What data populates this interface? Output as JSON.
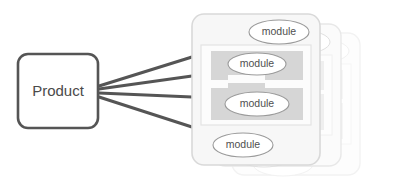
{
  "diagram": {
    "type": "product-modules-architecture",
    "canvas": {
      "width": 411,
      "height": 185,
      "background": "#ffffff"
    },
    "colors": {
      "product_border": "#555555",
      "product_fill": "#ffffff",
      "product_text": "#4a4a4a",
      "connector_line": "#555555",
      "card_border": "#d9d9d9",
      "card_fill": "#f7f7f7",
      "inner_panel_fill": "#fcfcfc",
      "inner_panel_border": "#e3e3e3",
      "band_fill": "#d6d6d6",
      "module_fill": "#ffffff",
      "module_border": "#9a9a9a",
      "module_text": "#4f4f4f",
      "ghost_card_border_1": "#e8e8e8",
      "ghost_card_border_2": "#f2f2f2"
    },
    "product": {
      "label": "Product",
      "x": 18,
      "y": 54,
      "width": 80,
      "height": 74,
      "radius": 10
    },
    "connectors": [
      {
        "name": "connector-1",
        "x1": 99,
        "y1": 86,
        "x2": 192,
        "y2": 57
      },
      {
        "name": "connector-2",
        "x1": 99,
        "y1": 89,
        "x2": 192,
        "y2": 76
      },
      {
        "name": "connector-3",
        "x1": 99,
        "y1": 93,
        "x2": 192,
        "y2": 97
      },
      {
        "name": "connector-4",
        "x1": 99,
        "y1": 97,
        "x2": 192,
        "y2": 127
      }
    ],
    "ghost_cards": [
      {
        "name": "ghost-card-back",
        "x": 232,
        "y": 33,
        "width": 128,
        "height": 142,
        "radius": 12
      },
      {
        "name": "ghost-card-mid",
        "x": 213,
        "y": 24,
        "width": 128,
        "height": 142,
        "radius": 12
      }
    ],
    "main_card": {
      "name": "module-card-front",
      "x": 192,
      "y": 14,
      "width": 128,
      "height": 151,
      "radius": 12
    },
    "inner_panel": {
      "x": 201,
      "y": 45,
      "width": 110,
      "height": 80
    },
    "bands": [
      {
        "name": "interlock-band-upper",
        "x": 211,
        "y": 51,
        "width": 92,
        "height": 29
      },
      {
        "name": "interlock-band-lower",
        "x": 211,
        "y": 84,
        "width": 92,
        "height": 36
      }
    ],
    "modules": [
      {
        "name": "module-top",
        "label": "module",
        "cx": 279,
        "cy": 32,
        "rx": 30,
        "ry": 12
      },
      {
        "name": "module-upper",
        "label": "module",
        "cx": 257,
        "cy": 64,
        "rx": 29,
        "ry": 11
      },
      {
        "name": "module-lower",
        "label": "module",
        "cx": 257,
        "cy": 104,
        "rx": 32,
        "ry": 12
      },
      {
        "name": "module-bottom",
        "label": "module",
        "cx": 243,
        "cy": 145,
        "rx": 30,
        "ry": 12
      }
    ],
    "ghost_modules_mid": [
      {
        "name": "ghost-module-mid-top",
        "label": "module",
        "cx": 300,
        "cy": 42,
        "rx": 30,
        "ry": 12
      },
      {
        "name": "ghost-module-mid-upper",
        "label": "module",
        "cx": 278,
        "cy": 74,
        "rx": 29,
        "ry": 11
      },
      {
        "name": "ghost-module-mid-lower",
        "label": "module",
        "cx": 278,
        "cy": 114,
        "rx": 32,
        "ry": 12
      },
      {
        "name": "ghost-module-mid-bottom",
        "label": "module",
        "cx": 264,
        "cy": 155,
        "rx": 30,
        "ry": 12
      }
    ]
  }
}
